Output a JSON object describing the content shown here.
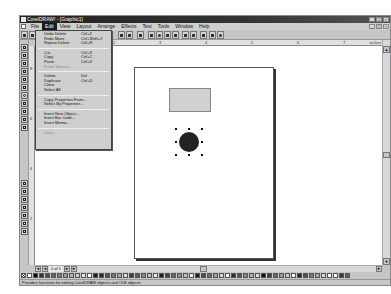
{
  "window": {
    "title": "CorelDRAW! - [Graphic1]",
    "controls": [
      "minimize",
      "maximize",
      "close"
    ]
  },
  "menubar": {
    "items": [
      {
        "label": "File"
      },
      {
        "label": "Edit",
        "active": true
      },
      {
        "label": "View"
      },
      {
        "label": "Layout"
      },
      {
        "label": "Arrange"
      },
      {
        "label": "Effects"
      },
      {
        "label": "Text"
      },
      {
        "label": "Tools"
      },
      {
        "label": "Window"
      },
      {
        "label": "Help"
      }
    ]
  },
  "edit_menu": {
    "items": [
      {
        "label": "Undo Delete",
        "shortcut": "Ctrl+Z"
      },
      {
        "label": "Redo Move",
        "shortcut": "Ctrl+Shift+Z"
      },
      {
        "label": "Repeat Delete",
        "shortcut": "Ctrl+R"
      },
      {
        "separator": true
      },
      {
        "label": "Cut",
        "shortcut": "Ctrl+X"
      },
      {
        "label": "Copy",
        "shortcut": "Ctrl+C"
      },
      {
        "label": "Paste",
        "shortcut": "Ctrl+V"
      },
      {
        "label": "Paste Special...",
        "disabled": true
      },
      {
        "separator": true
      },
      {
        "label": "Delete",
        "shortcut": "Del"
      },
      {
        "label": "Duplicate",
        "shortcut": "Ctrl+D"
      },
      {
        "label": "Clone"
      },
      {
        "label": "Select All"
      },
      {
        "separator": true
      },
      {
        "label": "Copy Properties From..."
      },
      {
        "label": "Select By Properties..."
      },
      {
        "separator": true
      },
      {
        "label": "Insert New Object..."
      },
      {
        "label": "Insert Bar Code..."
      },
      {
        "label": "Insert Memo..."
      },
      {
        "separator": true
      },
      {
        "label": "Links...",
        "disabled": true
      }
    ]
  },
  "ruler": {
    "h_ticks": [
      "1",
      "2",
      "3",
      "4",
      "5",
      "6",
      "7"
    ],
    "h_unit": "inches",
    "v_ticks": [
      "8",
      "6",
      "4",
      "2"
    ]
  },
  "page_nav": {
    "label": "1 of 1"
  },
  "statusbar": {
    "text": "Provides functions for editing CorelDRAW objects and OLE objects"
  },
  "palette": {
    "colors": [
      "#ffffff",
      "#000000",
      "#333333",
      "#4d4d4d",
      "#666666",
      "#808080",
      "#999999",
      "#b3b3b3",
      "#cccccc",
      "#e6e6e6",
      "#ffffff",
      "#1a1a1a",
      "#2a2a2a",
      "#555555",
      "#777777",
      "#aaaaaa",
      "#dddddd",
      "#3a3a3a",
      "#5a5a5a",
      "#8a8a8a",
      "#bbbbbb",
      "#eeeeee",
      "#222222",
      "#444444",
      "#6a6a6a",
      "#909090",
      "#c0c0c0",
      "#f0f0f0",
      "#1f1f1f",
      "#4a4a4a",
      "#727272",
      "#a0a0a0",
      "#d0d0d0",
      "#fafafa",
      "#2f2f2f",
      "#575757",
      "#858585",
      "#b0b0b0",
      "#e0e0e0",
      "#101010",
      "#3f3f3f",
      "#676767",
      "#959595",
      "#c8c8c8",
      "#f5f5f5",
      "#262626",
      "#4f4f4f",
      "#7a7a7a",
      "#a8a8a8",
      "#d8d8d8",
      "#ffffff",
      "#ffffff",
      "#363636",
      "#5f5f5f"
    ]
  }
}
